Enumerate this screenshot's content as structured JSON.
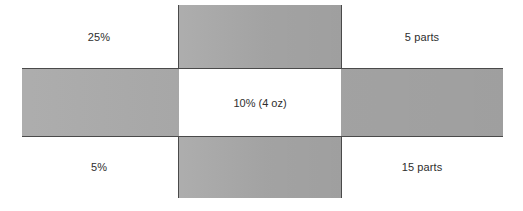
{
  "diagram": {
    "type": "alligation-grid",
    "colors": {
      "band_fill": "#a9a9a9",
      "band_border": "#4a4a4a",
      "center_fill": "#ffffff",
      "text": "#2e2e2e",
      "background": "#ffffff"
    },
    "center": {
      "label": "10% (4 oz)"
    },
    "corners": {
      "top_left": "25%",
      "top_right": "5 parts",
      "bottom_left": "5%",
      "bottom_right": "15 parts"
    }
  },
  "chart_data": {
    "type": "table",
    "cells": [
      {
        "position": "top-left",
        "label": "25%",
        "role": "higher-strength"
      },
      {
        "position": "top-center",
        "label": "",
        "role": "band"
      },
      {
        "position": "top-right",
        "label": "5 parts",
        "role": "parts-of-higher-strength"
      },
      {
        "position": "middle-left",
        "label": "",
        "role": "band"
      },
      {
        "position": "middle-center",
        "label": "10% (4 oz)",
        "role": "desired-strength-and-quantity"
      },
      {
        "position": "middle-right",
        "label": "",
        "role": "band"
      },
      {
        "position": "bottom-left",
        "label": "5%",
        "role": "lower-strength"
      },
      {
        "position": "bottom-center",
        "label": "",
        "role": "band"
      },
      {
        "position": "bottom-right",
        "label": "15 parts",
        "role": "parts-of-lower-strength"
      }
    ],
    "values": [
      25,
      10,
      5,
      5,
      15,
      4
    ],
    "value_labels": [
      "25%",
      "10%",
      "5%",
      "5 parts",
      "15 parts",
      "4 oz"
    ],
    "grid": true,
    "legend": "none"
  }
}
